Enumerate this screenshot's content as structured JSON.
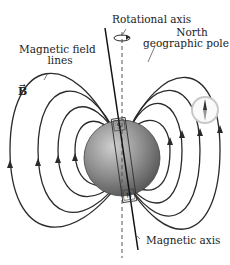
{
  "labels": {
    "rotational_axis": "Rotational axis",
    "north_pole_line1": "North",
    "north_pole_line2": "geographic pole",
    "field_lines_line1": "Magnetic field",
    "field_lines_line2": "lines",
    "b_vector": "B",
    "magnetic_axis": "Magnetic axis"
  },
  "magnet": {
    "top_pole": "S",
    "bottom_pole": "N"
  },
  "colors": {
    "line": "#2a2a2a",
    "earth": "#8a8a8a",
    "compass_rim": "#c8c8c8"
  }
}
